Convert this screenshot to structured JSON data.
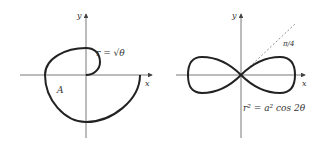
{
  "figures": [
    {
      "name": "spiral",
      "axis_x_label": "x",
      "axis_y_label": "y",
      "equation": "r = √θ",
      "region_label": "A"
    },
    {
      "name": "lemniscate",
      "axis_x_label": "x",
      "axis_y_label": "y",
      "equation": "r² = a² cos 2θ",
      "angle_label": "π/4"
    }
  ],
  "colors": {
    "curve": "#222222",
    "axis": "#555555",
    "dash": "#777777"
  }
}
